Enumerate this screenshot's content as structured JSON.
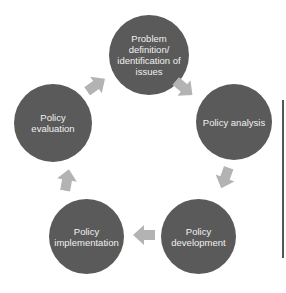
{
  "diagram": {
    "type": "policy-cycle",
    "colors": {
      "node_fill": "#5a5a5a",
      "node_text": "#f0f0f0",
      "arrow_fill": "#b3b3b3",
      "side_line": "#555555"
    },
    "nodes": [
      {
        "id": "problem",
        "label": "Problem definition/ identification of issues"
      },
      {
        "id": "analysis",
        "label": "Policy analysis"
      },
      {
        "id": "development",
        "label": "Policy development"
      },
      {
        "id": "implementation",
        "label": "Policy implementation"
      },
      {
        "id": "evaluation",
        "label": "Policy evaluation"
      }
    ],
    "edges": [
      {
        "from": "problem",
        "to": "analysis"
      },
      {
        "from": "analysis",
        "to": "development"
      },
      {
        "from": "development",
        "to": "implementation"
      },
      {
        "from": "implementation",
        "to": "evaluation"
      },
      {
        "from": "evaluation",
        "to": "problem"
      }
    ]
  }
}
